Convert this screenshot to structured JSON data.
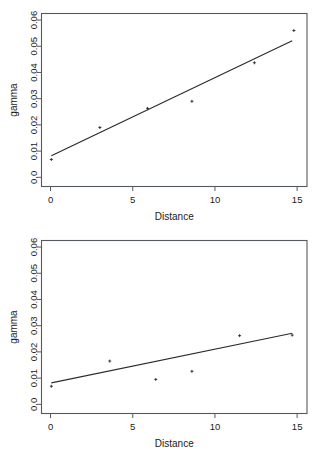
{
  "figure": {
    "panels": [
      {
        "name": "top-panel",
        "xlabel": "Distance",
        "ylabel": "gamma",
        "xticks": [
          "0",
          "5",
          "10",
          "15"
        ],
        "yticks": [
          "0.0",
          "0.01",
          "0.02",
          "0.03",
          "0.04",
          "0.05",
          "0.06"
        ]
      },
      {
        "name": "bottom-panel",
        "xlabel": "Distance",
        "ylabel": "gamma",
        "xticks": [
          "0",
          "5",
          "10",
          "15"
        ],
        "yticks": [
          "0.0",
          "0.01",
          "0.02",
          "0.03",
          "0.04",
          "0.05",
          "0.06"
        ]
      }
    ]
  },
  "chart_data": [
    {
      "type": "scatter",
      "title": "",
      "xlabel": "Distance",
      "ylabel": "gamma",
      "xlim": [
        -0.55,
        15.6
      ],
      "ylim": [
        -0.0035,
        0.0625
      ],
      "xticks": [
        0,
        5,
        10,
        15
      ],
      "yticks": [
        0.0,
        0.01,
        0.02,
        0.03,
        0.04,
        0.05,
        0.06
      ],
      "grid": false,
      "legend": "none",
      "x": [
        0.05,
        3.0,
        5.9,
        8.6,
        12.4,
        14.8
      ],
      "y": [
        0.0068,
        0.019,
        0.0263,
        0.029,
        0.0437,
        0.056
      ],
      "series": [
        {
          "name": "semivariogram points",
          "x": [
            0.05,
            3.0,
            5.9,
            8.6,
            12.4,
            14.8
          ],
          "values": [
            0.0068,
            0.019,
            0.0263,
            0.029,
            0.0437,
            0.056
          ]
        },
        {
          "name": "fitted line",
          "type": "line",
          "x": [
            0.05,
            14.7
          ],
          "values": [
            0.0082,
            0.0521
          ]
        }
      ]
    },
    {
      "type": "scatter",
      "title": "",
      "xlabel": "Distance",
      "ylabel": "gamma",
      "xlim": [
        -0.55,
        15.6
      ],
      "ylim": [
        -0.0035,
        0.0625
      ],
      "xticks": [
        0,
        5,
        10,
        15
      ],
      "yticks": [
        0.0,
        0.01,
        0.02,
        0.03,
        0.04,
        0.05,
        0.06
      ],
      "grid": false,
      "legend": "none",
      "x": [
        0.05,
        3.6,
        6.4,
        8.6,
        11.5,
        14.7
      ],
      "y": [
        0.0069,
        0.0165,
        0.0095,
        0.0126,
        0.0262,
        0.0264
      ],
      "series": [
        {
          "name": "semivariogram points",
          "x": [
            0.05,
            3.6,
            6.4,
            8.6,
            11.5,
            14.7
          ],
          "values": [
            0.0069,
            0.0165,
            0.0095,
            0.0126,
            0.0262,
            0.0264
          ]
        },
        {
          "name": "fitted line",
          "type": "line",
          "x": [
            0.05,
            14.7
          ],
          "values": [
            0.0082,
            0.0271
          ]
        }
      ]
    }
  ]
}
